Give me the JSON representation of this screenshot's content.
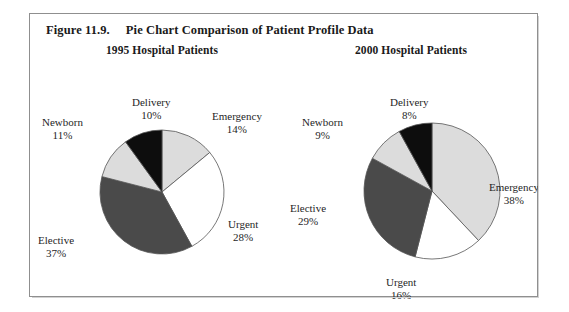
{
  "figure": {
    "number": "Figure 11.9.",
    "caption": "Pie Chart Comparison of Patient Profile Data"
  },
  "colors": {
    "black_slice": "#0d0d0d",
    "dark_gray_slice": "#4a4a4a",
    "light_gray_slice": "#dcdcdc",
    "white_slice": "#ffffff",
    "slice_outline": "#555555",
    "frame_border": "#8f8f8f",
    "background": "#ffffff",
    "text": "#1a1a1a"
  },
  "chart_data": [
    {
      "type": "pie",
      "title": "1995 Hospital Patients",
      "start_angle": 0,
      "direction": "clockwise",
      "center": {
        "x": 126,
        "y": 148
      },
      "radius": 62,
      "categories": [
        "Emergency",
        "Urgent",
        "Elective",
        "Newborn",
        "Delivery"
      ],
      "values": [
        14,
        28,
        37,
        11,
        10
      ],
      "unit": "percent",
      "slices": [
        {
          "label": "Emergency",
          "value": 14,
          "value_text": "14%",
          "fill": "#dcdcdc",
          "label_x": 176,
          "label_y": 66
        },
        {
          "label": "Urgent",
          "value": 28,
          "value_text": "28%",
          "fill": "#ffffff",
          "label_x": 192,
          "label_y": 174
        },
        {
          "label": "Elective",
          "value": 37,
          "value_text": "37%",
          "fill": "#4a4a4a",
          "label_x": 2,
          "label_y": 190
        },
        {
          "label": "Newborn",
          "value": 11,
          "value_text": "11%",
          "fill": "#dcdcdc",
          "label_x": 6,
          "label_y": 72
        },
        {
          "label": "Delivery",
          "value": 10,
          "value_text": "10%",
          "fill": "#0d0d0d",
          "label_x": 96,
          "label_y": 52
        }
      ]
    },
    {
      "type": "pie",
      "title": "2000 Hospital Patients",
      "start_angle": 0,
      "direction": "clockwise",
      "center": {
        "x": 146,
        "y": 147
      },
      "radius": 68,
      "categories": [
        "Emergency",
        "Urgent",
        "Elective",
        "Newborn",
        "Delivery"
      ],
      "values": [
        38,
        16,
        29,
        9,
        8
      ],
      "unit": "percent",
      "slices": [
        {
          "label": "Emergency",
          "value": 38,
          "value_text": "38%",
          "fill": "#dcdcdc",
          "label_x": 203,
          "label_y": 137
        },
        {
          "label": "Urgent",
          "value": 16,
          "value_text": "16%",
          "fill": "#ffffff",
          "label_x": 100,
          "label_y": 232
        },
        {
          "label": "Elective",
          "value": 29,
          "value_text": "29%",
          "fill": "#4a4a4a",
          "label_x": 4,
          "label_y": 158
        },
        {
          "label": "Newborn",
          "value": 9,
          "value_text": "9%",
          "fill": "#dcdcdc",
          "label_x": 16,
          "label_y": 72
        },
        {
          "label": "Delivery",
          "value": 8,
          "value_text": "8%",
          "fill": "#0d0d0d",
          "label_x": 104,
          "label_y": 52
        }
      ]
    }
  ]
}
